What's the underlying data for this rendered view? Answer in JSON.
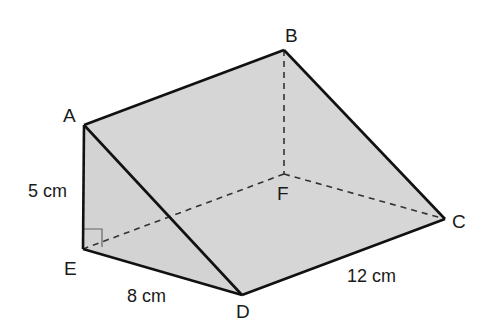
{
  "diagram": {
    "type": "triangular-prism",
    "colors": {
      "fill": "#d6d6d6",
      "edge": "#111111",
      "hidden_edge": "#333333",
      "right_angle_marker": "#555555"
    },
    "vertices": {
      "A": {
        "label": "A",
        "x": 84,
        "y": 125
      },
      "B": {
        "label": "B",
        "x": 284,
        "y": 50
      },
      "C": {
        "label": "C",
        "x": 445,
        "y": 219
      },
      "D": {
        "label": "D",
        "x": 242,
        "y": 295
      },
      "E": {
        "label": "E",
        "x": 83,
        "y": 249
      },
      "F": {
        "label": "F",
        "x": 284,
        "y": 174
      }
    },
    "visible_edges": [
      "AB",
      "BC",
      "CD",
      "DE",
      "EA",
      "AD"
    ],
    "hidden_edges": [
      "BF",
      "FE",
      "FC"
    ],
    "right_angle_at": "E",
    "dimensions": {
      "AE": "5 cm",
      "ED": "8 cm",
      "DC": "12 cm"
    }
  }
}
